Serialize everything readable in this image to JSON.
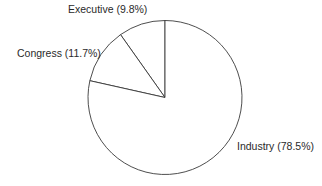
{
  "chart_data": {
    "type": "pie",
    "title": "",
    "categories": [
      "Executive",
      "Congress",
      "Industry"
    ],
    "values": [
      9.8,
      11.7,
      78.5
    ],
    "unit": "%",
    "labels": [
      "Executive (9.8%)",
      "Congress (11.7%)",
      "Industry (78.5%)"
    ],
    "start_angle": "12 o'clock",
    "direction": "counter-clockwise from top: Executive, Congress, then Industry",
    "fill_colors": [
      "#ffffff",
      "#ffffff",
      "#ffffff"
    ],
    "stroke_color": "#3a3a3a",
    "legend": "none (labels placed beside slices)"
  },
  "labels": {
    "executive": "Executive (9.8%)",
    "congress": "Congress (11.7%)",
    "industry": "Industry (78.5%)"
  }
}
